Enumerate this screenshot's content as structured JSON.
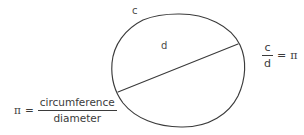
{
  "figure": {
    "type": "geometry-diagram",
    "background_color": "#ffffff",
    "stroke_color": "#3b3b3b",
    "text_color": "#3b3b3b"
  },
  "circle": {
    "label_circumference": "c",
    "label_diameter": "d",
    "center_x": 178,
    "center_y": 70,
    "radius_x": 66,
    "radius_y": 57,
    "bounds": {
      "left": 112,
      "top": 14,
      "right": 244,
      "bottom": 127
    },
    "diameter_line": {
      "x1": 118,
      "y1": 92,
      "x2": 238,
      "y2": 44
    }
  },
  "equation_definition": {
    "symbol": "π",
    "operator": "=",
    "numerator": "circumference",
    "denominator": "diameter"
  },
  "equation_ratio": {
    "numerator": "c",
    "denominator": "d",
    "operator": "=",
    "result": "π"
  }
}
